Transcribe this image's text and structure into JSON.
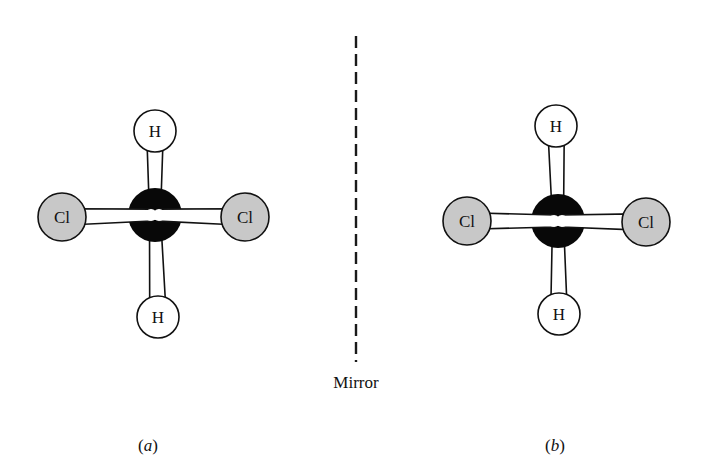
{
  "figure": {
    "mirror": {
      "label": "Mirror",
      "x": 356,
      "y1": 36,
      "y2": 362
    },
    "colors": {
      "carbon": "#080808",
      "chlorine": "#c8c8c8",
      "hydrogen": "#ffffff",
      "bond": "#ffffff",
      "outline": "#111111"
    },
    "molecules": [
      {
        "id": "a",
        "caption_open": "(",
        "caption_letter": "a",
        "caption_close": ")",
        "caption_x": 148,
        "caption_y": 451,
        "center": {
          "symbol": "C",
          "x": 155,
          "y": 215,
          "r": 27
        },
        "atoms": [
          {
            "symbol": "H",
            "x": 155,
            "y": 131,
            "r": 21
          },
          {
            "symbol": "H",
            "x": 158,
            "y": 317,
            "r": 21
          },
          {
            "symbol": "Cl",
            "x": 62,
            "y": 217,
            "r": 24
          },
          {
            "symbol": "Cl",
            "x": 245,
            "y": 217,
            "r": 24
          }
        ]
      },
      {
        "id": "b",
        "caption_open": "(",
        "caption_letter": "b",
        "caption_close": ")",
        "caption_x": 555,
        "caption_y": 451,
        "center": {
          "symbol": "C",
          "x": 558,
          "y": 221,
          "r": 27
        },
        "atoms": [
          {
            "symbol": "H",
            "x": 556,
            "y": 126,
            "r": 21
          },
          {
            "symbol": "H",
            "x": 559,
            "y": 314,
            "r": 21
          },
          {
            "symbol": "Cl",
            "x": 467,
            "y": 221,
            "r": 24
          },
          {
            "symbol": "Cl",
            "x": 646,
            "y": 222,
            "r": 24
          }
        ]
      }
    ]
  }
}
